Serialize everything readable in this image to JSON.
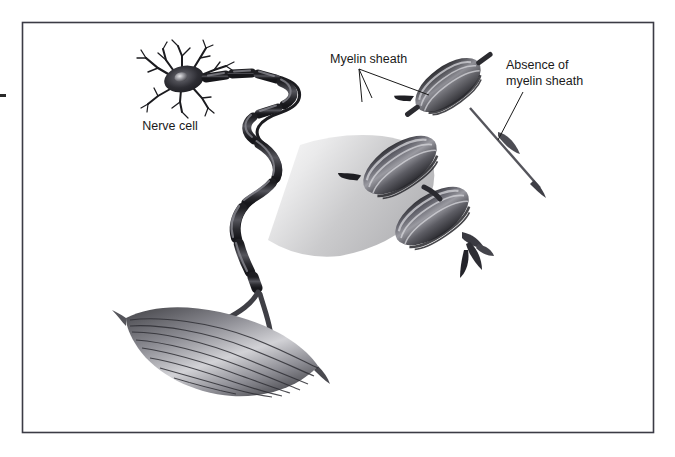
{
  "figure": {
    "name": "nerve-cell-myelin-sheath-diagram",
    "background_color": "#ffffff",
    "frame": {
      "border_color": "#3b3b45",
      "x": 22,
      "y": 22,
      "width": 631,
      "height": 410
    },
    "ink_color": "#1a1a1a",
    "illustration_style": "grayscale medical illustration"
  },
  "labels": [
    {
      "id": "nerve-cell",
      "text": "Nerve cell",
      "x": 170,
      "y": 126,
      "anchor": "middle",
      "lines": [
        "Nerve cell"
      ]
    },
    {
      "id": "myelin-sheath",
      "text": "Myelin sheath",
      "x": 330,
      "y": 63,
      "anchor": "start",
      "lines": [
        "Myelin sheath"
      ]
    },
    {
      "id": "absence-of-myelin-sheath",
      "text": "Absence of myelin sheath",
      "x": 506,
      "y": 70,
      "anchor": "start",
      "lines": [
        "Absence of",
        "myelin sheath"
      ]
    }
  ],
  "label_lines": {
    "myelin_sheath_line_1": "Myelin sheath",
    "absence_line_1": "Absence of",
    "absence_line_2": "myelin sheath",
    "nerve_cell_line_1": "Nerve cell"
  },
  "structures": [
    {
      "id": "neuron-soma",
      "name": "Nerve cell body (soma) with nucleus",
      "interactable": false
    },
    {
      "id": "dendrites",
      "name": "Dendrite branches",
      "interactable": false
    },
    {
      "id": "myelinated-axon",
      "name": "Winding myelinated axon with nodes of Ranvier",
      "interactable": false
    },
    {
      "id": "magnification-cone",
      "name": "Gray magnification beam",
      "interactable": false
    },
    {
      "id": "magnified-myelin-upper",
      "name": "Enlarged myelin sheath segment (upper)",
      "interactable": false
    },
    {
      "id": "magnified-myelin-lower",
      "name": "Enlarged myelin sheath segments (lower pair)",
      "interactable": false
    },
    {
      "id": "bare-axon",
      "name": "Unmyelinated (bare) axon segment",
      "interactable": false
    },
    {
      "id": "muscle-fiber",
      "name": "Striated muscle fiber with nerve terminals",
      "interactable": false
    }
  ],
  "palette": {
    "ink": "#1a1a1a",
    "frame": "#3b3b45",
    "sheath_dark": "#3a3a3e",
    "sheath_mid": "#6d6d73",
    "sheath_light": "#b9b9bd",
    "cone_light": "#f1f1f1",
    "cone_dark": "#b6b6b8",
    "muscle_dark": "#4a4a4e",
    "muscle_light": "#cfcfd2",
    "background": "#ffffff"
  }
}
